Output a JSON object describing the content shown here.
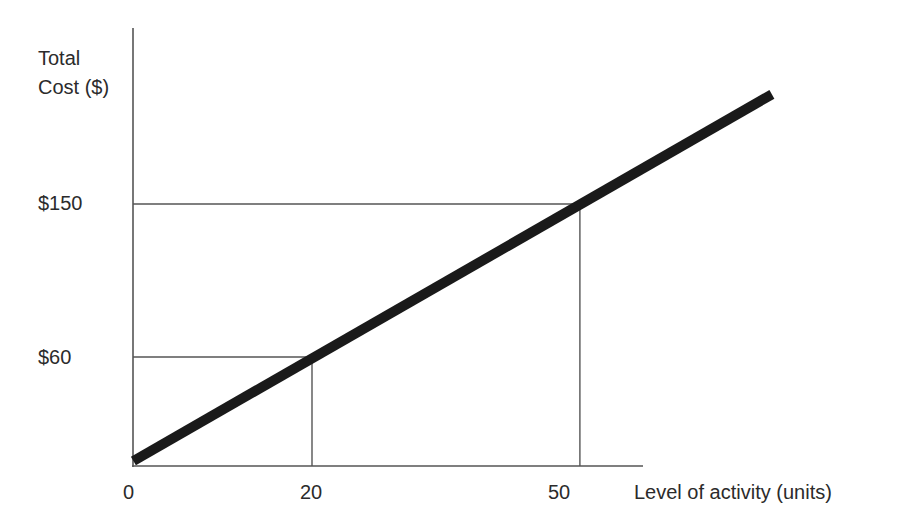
{
  "chart_data": {
    "type": "line",
    "title": "",
    "xlabel": "Level of activity (units)",
    "ylabel": "Total Cost ($)",
    "ylabel_lines": [
      "Total",
      "Cost ($)"
    ],
    "xticks": [
      "0",
      "20",
      "50"
    ],
    "yticks": [
      "$60",
      "$150"
    ],
    "grid": false,
    "legend": null,
    "series": [
      {
        "name": "Total cost",
        "x": [
          0,
          20,
          50,
          71.5
        ],
        "values": [
          0,
          60,
          150,
          214.5
        ],
        "color": "#1a1a1a"
      }
    ],
    "reference_lines": [
      {
        "x": 20,
        "y": 60
      },
      {
        "x": 50,
        "y": 150
      }
    ],
    "xlim": [
      0,
      57
    ],
    "ylim": [
      0,
      255
    ]
  },
  "labels": {
    "y_title_1": "Total",
    "y_title_2": "Cost ($)",
    "y_tick_150": "$150",
    "y_tick_60": "$60",
    "x_tick_0": "0",
    "x_tick_20": "20",
    "x_tick_50": "50",
    "x_title": "Level of activity (units)"
  },
  "colors": {
    "axis": "#555555",
    "line": "#1a1a1a",
    "text": "#2b2b2b"
  }
}
